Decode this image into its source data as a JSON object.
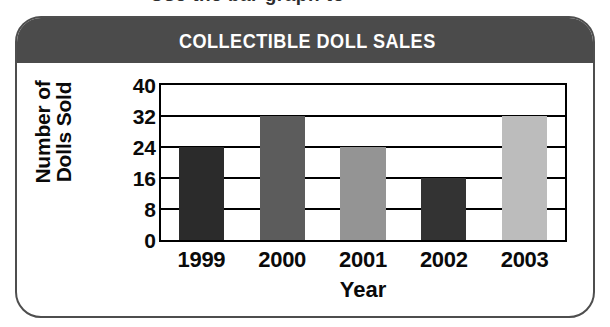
{
  "top_partial_text": "Use the bar graph to",
  "card": {
    "title": "COLLECTIBLE DOLL SALES",
    "title_band_color": "#4b4b4b",
    "title_text_color": "#ffffff",
    "border_color": "#4e4e4e",
    "background_color": "#ffffff"
  },
  "chart_data": {
    "type": "bar",
    "title": "COLLECTIBLE DOLL SALES",
    "xlabel": "Year",
    "ylabel": "Number of Dolls Sold",
    "ylabel_line1": "Number of",
    "ylabel_line2": "Dolls Sold",
    "categories": [
      "1999",
      "2000",
      "2001",
      "2002",
      "2003"
    ],
    "values": [
      24,
      32,
      24,
      16,
      32
    ],
    "bar_colors": [
      "#2b2b2b",
      "#5c5c5c",
      "#949494",
      "#333333",
      "#bcbcbc"
    ],
    "ylim": [
      0,
      40
    ],
    "yticks": [
      0,
      8,
      16,
      24,
      32,
      40
    ],
    "ytick_labels": [
      "0",
      "8",
      "16",
      "24",
      "32",
      "40"
    ],
    "grid": true,
    "grid_color": "#000000",
    "legend": false,
    "axis_color": "#000000",
    "plot_background": "#ffffff"
  }
}
